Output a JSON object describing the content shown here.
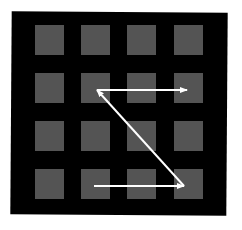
{
  "diagram": {
    "colors": {
      "background": "#ffffff",
      "panel": "#000000",
      "cell": "#545454",
      "arrow": "#ffffff"
    },
    "grid": {
      "rows": 4,
      "cols": 4,
      "col_x": [
        35,
        81,
        127,
        174
      ],
      "row_y": [
        25,
        73,
        121,
        169
      ],
      "cell_w": 29,
      "cell_h": 30
    },
    "arrows": [
      {
        "name": "bottom-arrow",
        "from": [
          94,
          186
        ],
        "to": [
          184,
          186
        ]
      },
      {
        "name": "diagonal-arrow",
        "from": [
          184,
          186
        ],
        "to": [
          97,
          90
        ]
      },
      {
        "name": "top-arrow",
        "from": [
          97,
          90
        ],
        "to": [
          187,
          90
        ]
      }
    ]
  }
}
